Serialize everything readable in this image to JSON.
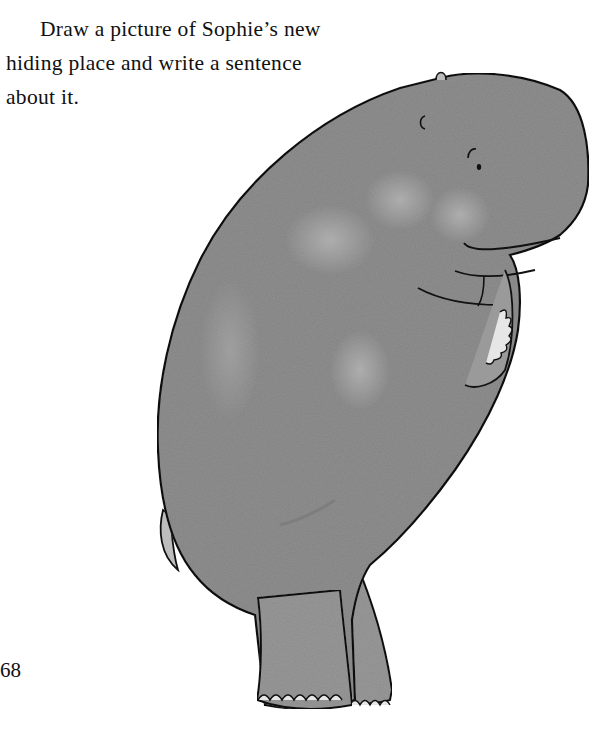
{
  "page": {
    "prompt_lines": [
      "Draw a picture of Sophie’s new",
      "hiding place and write a sentence",
      "about it."
    ],
    "page_number": "68"
  },
  "illustration": {
    "subject": "hippo-standing",
    "colors": {
      "body_fill": "#8f8f8f",
      "body_light": "#a9a9a9",
      "outline": "#111111",
      "toenail": "#e6e6e6"
    }
  }
}
